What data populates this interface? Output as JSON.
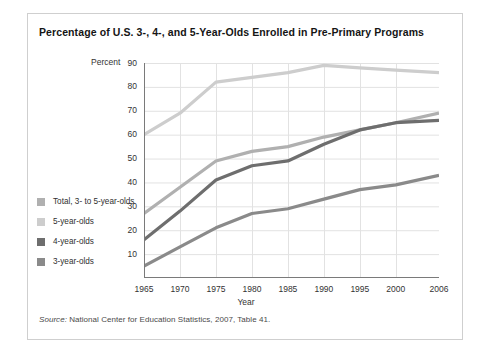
{
  "figure": {
    "title": "Percentage of U.S. 3-, 4-, and 5-Year-Olds Enrolled in Pre-Primary Programs",
    "source_label": "Source:",
    "source_text": " National Center for Education Statistics, 2007, Table 41.",
    "percent_label": "Percent"
  },
  "legend": {
    "position": "left-outside",
    "items": [
      {
        "label": "Total, 3- to 5-year-olds",
        "color": "#b0b0b0"
      },
      {
        "label": "5-year-olds",
        "color": "#cdcdcd"
      },
      {
        "label": "4-year-olds",
        "color": "#6e6e6e"
      },
      {
        "label": "3-year-olds",
        "color": "#8a8a8a"
      }
    ]
  },
  "chart_data": {
    "type": "line",
    "title": "Percentage of U.S. 3-, 4-, and 5-Year-Olds Enrolled in Pre-Primary Programs",
    "xlabel": "Year",
    "ylabel": "Percent",
    "x": [
      1965,
      1970,
      1975,
      1980,
      1985,
      1990,
      1995,
      2000,
      2006
    ],
    "xlim": [
      1965,
      2006
    ],
    "ylim": [
      0,
      90
    ],
    "xticks": [
      1965,
      1970,
      1975,
      1980,
      1985,
      1990,
      1995,
      2000,
      2006
    ],
    "yticks": [
      10,
      20,
      30,
      40,
      50,
      60,
      70,
      80,
      90
    ],
    "grid": true,
    "series": [
      {
        "name": "5-year-olds",
        "color": "#cdcdcd",
        "values": [
          60,
          69,
          82,
          84,
          86,
          89,
          88,
          87,
          86
        ]
      },
      {
        "name": "Total, 3- to 5-year-olds",
        "color": "#b0b0b0",
        "values": [
          27,
          38,
          49,
          53,
          55,
          59,
          62,
          65,
          69
        ]
      },
      {
        "name": "4-year-olds",
        "color": "#6e6e6e",
        "values": [
          16,
          28,
          41,
          47,
          49,
          56,
          62,
          65,
          66
        ]
      },
      {
        "name": "3-year-olds",
        "color": "#8a8a8a",
        "values": [
          5,
          13,
          21,
          27,
          29,
          33,
          37,
          39,
          43
        ]
      }
    ]
  }
}
